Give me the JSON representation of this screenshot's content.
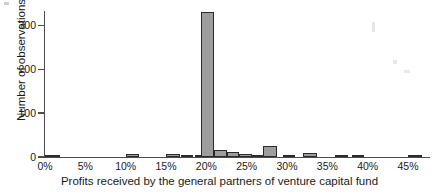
{
  "chart_data": {
    "type": "bar",
    "title": "",
    "subtitle": "",
    "xlabel": "Profits received by the general partners of venture capital fund",
    "ylabel": "Number of observations",
    "xlim": [
      0,
      47.6
    ],
    "ylim": [
      0,
      330
    ],
    "grid": false,
    "legend": null,
    "bin_width_percent": 1,
    "bar_color": "#9d9d9d",
    "bar_edge_color": "#2b2b2b",
    "axis_color": "#4d4d4d",
    "x_tick_labels": [
      "0%",
      "5%",
      "10%",
      "15%",
      "20%",
      "25%",
      "30%",
      "35%",
      "40%",
      "45%"
    ],
    "x_tick_values": [
      0,
      5,
      10,
      15,
      20,
      25,
      30,
      35,
      40,
      45
    ],
    "y_tick_labels": [
      "0",
      "100",
      "200",
      "300"
    ],
    "y_tick_values": [
      0,
      100,
      200,
      300
    ],
    "categories": [
      "0%",
      "1%",
      "2%",
      "3%",
      "4%",
      "5%",
      "6%",
      "7%",
      "8%",
      "9%",
      "10%",
      "11%",
      "12%",
      "13%",
      "14%",
      "15%",
      "16%",
      "17%",
      "18%",
      "19%",
      "20%",
      "21%",
      "22%",
      "23%",
      "24%",
      "25%",
      "26%",
      "27%",
      "28%",
      "29%",
      "30%",
      "31%",
      "32%",
      "33%",
      "34%",
      "35%",
      "36%",
      "37%",
      "38%",
      "39%",
      "40%",
      "41%",
      "42%",
      "43%",
      "44%",
      "45%",
      "46%"
    ],
    "values": [
      3,
      2,
      0,
      0,
      0,
      0,
      0,
      0,
      0,
      0,
      6,
      0,
      0,
      0,
      0,
      8,
      7,
      2,
      2,
      3,
      330,
      15,
      11,
      8,
      4,
      24,
      2,
      4,
      2,
      1,
      10,
      0,
      0,
      0,
      2,
      2,
      2,
      0,
      0,
      0,
      0,
      0,
      0,
      0,
      0,
      2,
      0
    ],
    "bars": [
      {
        "x": 0.0,
        "width": 1.9,
        "value": 3
      },
      {
        "x": 10.1,
        "width": 1.5,
        "value": 6
      },
      {
        "x": 15.0,
        "width": 1.7,
        "value": 8
      },
      {
        "x": 16.8,
        "width": 1.6,
        "value": 3
      },
      {
        "x": 18.6,
        "width": 1.2,
        "value": 2
      },
      {
        "x": 19.3,
        "width": 1.6,
        "value": 330
      },
      {
        "x": 21.0,
        "width": 1.5,
        "value": 15
      },
      {
        "x": 22.5,
        "width": 1.6,
        "value": 11
      },
      {
        "x": 24.1,
        "width": 1.5,
        "value": 8
      },
      {
        "x": 25.6,
        "width": 1.4,
        "value": 4
      },
      {
        "x": 27.0,
        "width": 1.8,
        "value": 24
      },
      {
        "x": 29.5,
        "width": 1.5,
        "value": 4
      },
      {
        "x": 32.0,
        "width": 1.7,
        "value": 10
      },
      {
        "x": 36.0,
        "width": 1.6,
        "value": 2
      },
      {
        "x": 38.0,
        "width": 1.5,
        "value": 2
      },
      {
        "x": 45.0,
        "width": 1.7,
        "value": 2
      }
    ]
  },
  "figure": {
    "axis_x_name": "x-axis",
    "axis_y_name": "y-axis"
  }
}
